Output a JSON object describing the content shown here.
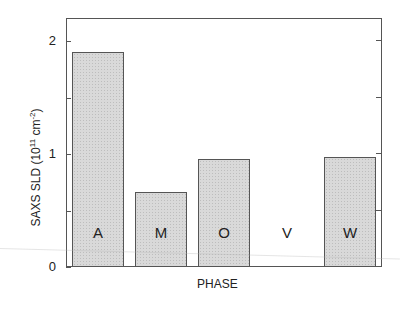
{
  "chart_data": {
    "type": "bar",
    "title": "",
    "xlabel": "PHASE",
    "ylabel": "SAXS SLD (10^11 cm^-2)",
    "ylabel_parts": {
      "prefix": "SAXS SLD (10",
      "exp1": "11",
      "mid": " cm",
      "exp2": "-2",
      "suffix": ")"
    },
    "categories": [
      "A",
      "M",
      "O",
      "V",
      "W"
    ],
    "values": [
      1.9,
      0.66,
      0.96,
      0.0,
      0.97
    ],
    "ylim": [
      0,
      2.2
    ],
    "yticks": [
      0,
      0.5,
      1,
      1.5,
      2
    ],
    "ytick_labels": [
      "0",
      "",
      "1",
      "",
      "2"
    ],
    "grid": false,
    "legend": null,
    "bar_fill": "#d9d9d9",
    "bar_edge": "#555555",
    "bar_label_position": "inside-bottom"
  }
}
